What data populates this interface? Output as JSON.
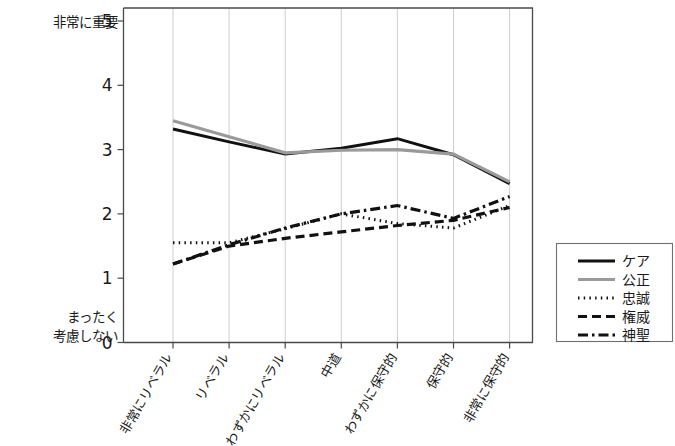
{
  "chart_data": {
    "type": "line",
    "title": "",
    "xlabel": "",
    "ylabel": "",
    "categories": [
      "非常にリベラル",
      "リベラル",
      "わずかにリベラル",
      "中道",
      "わずかに保守的",
      "保守的",
      "非常に保守的"
    ],
    "ylim": [
      0,
      5
    ],
    "yticks": [
      0,
      1,
      2,
      3,
      4,
      5
    ],
    "ytick_labels": [
      "0",
      "1",
      "2",
      "3",
      "4",
      "5"
    ],
    "y_axis_top_caption": "非常に重要",
    "y_axis_bottom_caption_line1": "まったく",
    "y_axis_bottom_caption_line2": "考慮しない",
    "grid": true,
    "grid_axis": "x",
    "legend_position": "right",
    "series": [
      {
        "name": "ケア",
        "values": [
          3.32,
          3.12,
          2.93,
          3.02,
          3.17,
          2.92,
          2.47
        ],
        "color": "#111111",
        "style": "solid",
        "dash": "none",
        "width": 3.0
      },
      {
        "name": "公正",
        "values": [
          3.45,
          3.2,
          2.95,
          2.99,
          3.0,
          2.93,
          2.5
        ],
        "color": "#9a9a9a",
        "style": "solid",
        "dash": "none",
        "width": 3.2
      },
      {
        "name": "忠誠",
        "values": [
          1.55,
          1.55,
          1.77,
          2.0,
          1.85,
          1.78,
          2.13
        ],
        "color": "#111111",
        "style": "dotted",
        "dash": "1.5 4.2",
        "width": 3.0
      },
      {
        "name": "権威",
        "values": [
          1.22,
          1.5,
          1.62,
          1.72,
          1.82,
          1.9,
          2.1
        ],
        "color": "#111111",
        "style": "dashed",
        "dash": "9 5",
        "width": 3.2
      },
      {
        "name": "神聖",
        "values": [
          1.22,
          1.52,
          1.78,
          2.0,
          2.13,
          1.93,
          2.27
        ],
        "color": "#111111",
        "style": "dashdot",
        "dash": "10 4 2.5 4",
        "width": 3.2
      }
    ]
  },
  "legend": {
    "items": [
      {
        "label": "ケア"
      },
      {
        "label": "公正"
      },
      {
        "label": "忠誠"
      },
      {
        "label": "権威"
      },
      {
        "label": "神聖"
      }
    ]
  }
}
